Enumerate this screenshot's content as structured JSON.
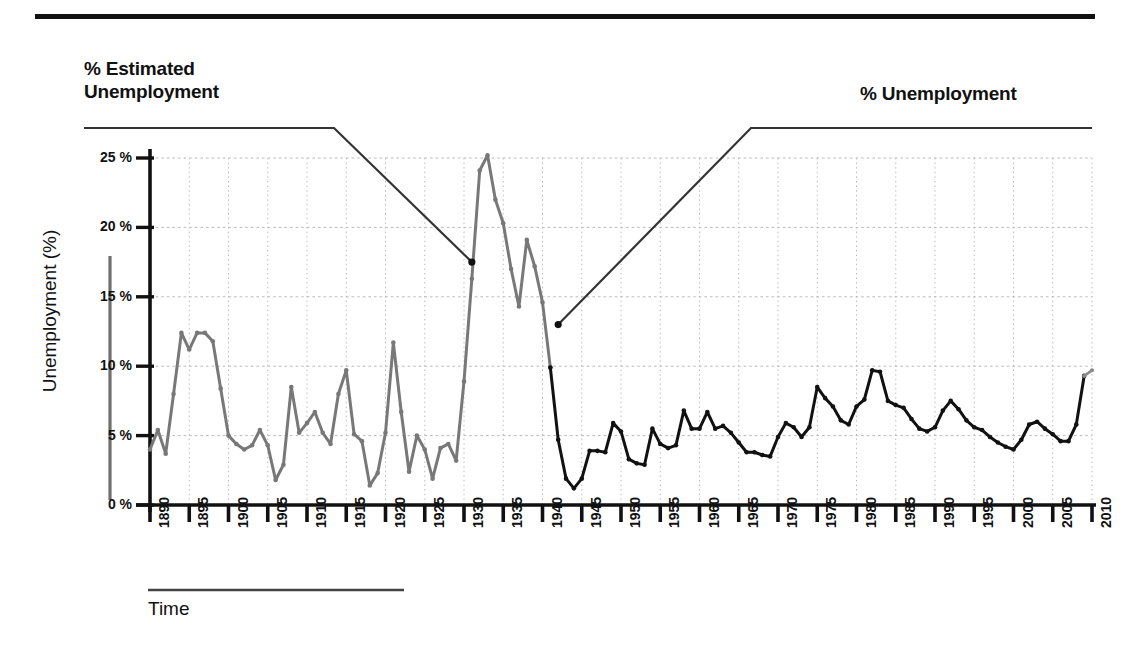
{
  "figure": {
    "top_rule": "horizontal-rule",
    "labels": {
      "left_annotation": "% Estimated\nUnemployment",
      "right_annotation": "% Unemployment"
    }
  },
  "chart_data": {
    "type": "line",
    "title": "",
    "xlabel": "Time",
    "ylabel": "Unemployment (%)",
    "xlim": [
      1890,
      2010
    ],
    "ylim": [
      0,
      25
    ],
    "grid": true,
    "grid_x_step": 5,
    "grid_y_step": 5,
    "legend_position": "annotations-with-leader-lines",
    "ytick_labels": [
      "25 %",
      "20 %",
      "15 %",
      "10 %",
      "5 %",
      "0 %"
    ],
    "ytick_values": [
      25,
      20,
      15,
      10,
      5,
      0
    ],
    "xtick_labels": [
      "1890",
      "1895",
      "1900",
      "1905",
      "1910",
      "1915",
      "1920",
      "1925",
      "1930",
      "1935",
      "1940",
      "1945",
      "1950",
      "1955",
      "1960",
      "1965",
      "1970",
      "1975",
      "1980",
      "1985",
      "1990",
      "1995",
      "2000",
      "2005",
      "2010"
    ],
    "xtick_values": [
      1890,
      1895,
      1900,
      1905,
      1910,
      1915,
      1920,
      1925,
      1930,
      1935,
      1940,
      1945,
      1950,
      1955,
      1960,
      1965,
      1970,
      1975,
      1980,
      1985,
      1990,
      1995,
      2000,
      2005,
      2010
    ],
    "colors": {
      "estimated_series": "#787878",
      "official_series": "#111111",
      "grid": "#b9b9b9",
      "axis": "#111111"
    },
    "series": [
      {
        "name": "% Estimated Unemployment",
        "color": "#787878",
        "x": [
          1890,
          1891,
          1892,
          1893,
          1894,
          1895,
          1896,
          1897,
          1898,
          1899,
          1900,
          1901,
          1902,
          1903,
          1904,
          1905,
          1906,
          1907,
          1908,
          1909,
          1910,
          1911,
          1912,
          1913,
          1914,
          1915,
          1916,
          1917,
          1918,
          1919,
          1920,
          1921,
          1922,
          1923,
          1924,
          1925,
          1926,
          1927,
          1928,
          1929,
          1930,
          1931,
          1932,
          1933,
          1934,
          1935,
          1936,
          1937,
          1938,
          1939,
          1940,
          1941
        ],
        "values": [
          4.0,
          5.4,
          3.7,
          8.0,
          12.4,
          11.2,
          12.4,
          12.4,
          11.8,
          8.4,
          5.0,
          4.4,
          4.0,
          4.3,
          5.4,
          4.3,
          1.8,
          2.9,
          8.5,
          5.2,
          5.9,
          6.7,
          5.2,
          4.4,
          8.0,
          9.7,
          5.1,
          4.6,
          1.4,
          2.3,
          5.2,
          11.7,
          6.7,
          2.4,
          5.0,
          4.0,
          1.9,
          4.1,
          4.4,
          3.2,
          8.9,
          16.3,
          24.1,
          25.2,
          22.0,
          20.3,
          17.0,
          14.3,
          19.1,
          17.2,
          14.6,
          9.9
        ]
      },
      {
        "name": "% Unemployment",
        "color": "#111111",
        "x": [
          1941,
          1942,
          1943,
          1944,
          1945,
          1946,
          1947,
          1948,
          1949,
          1950,
          1951,
          1952,
          1953,
          1954,
          1955,
          1956,
          1957,
          1958,
          1959,
          1960,
          1961,
          1962,
          1963,
          1964,
          1965,
          1966,
          1967,
          1968,
          1969,
          1970,
          1971,
          1972,
          1973,
          1974,
          1975,
          1976,
          1977,
          1978,
          1979,
          1980,
          1981,
          1982,
          1983,
          1984,
          1985,
          1986,
          1987,
          1988,
          1989,
          1990,
          1991,
          1992,
          1993,
          1994,
          1995,
          1996,
          1997,
          1998,
          1999,
          2000,
          2001,
          2002,
          2003,
          2004,
          2005,
          2006,
          2007,
          2008,
          2009
        ],
        "values": [
          9.9,
          4.7,
          1.9,
          1.2,
          1.9,
          3.9,
          3.9,
          3.8,
          5.9,
          5.3,
          3.3,
          3.0,
          2.9,
          5.5,
          4.4,
          4.1,
          4.3,
          6.8,
          5.5,
          5.5,
          6.7,
          5.5,
          5.7,
          5.2,
          4.5,
          3.8,
          3.8,
          3.6,
          3.5,
          4.9,
          5.9,
          5.6,
          4.9,
          5.6,
          8.5,
          7.7,
          7.1,
          6.1,
          5.8,
          7.1,
          7.6,
          9.7,
          9.6,
          7.5,
          7.2,
          7.0,
          6.2,
          5.5,
          5.3,
          5.6,
          6.8,
          7.5,
          6.9,
          6.1,
          5.6,
          5.4,
          4.9,
          4.5,
          4.2,
          4.0,
          4.7,
          5.8,
          6.0,
          5.5,
          5.1,
          4.6,
          4.6,
          5.8,
          9.3
        ]
      },
      {
        "name": "% Unemployment (final year)",
        "color": "#8a8a8a",
        "x": [
          2009,
          2010
        ],
        "values": [
          9.3,
          9.7
        ]
      }
    ],
    "annotations": [
      {
        "label": "% Estimated Unemployment",
        "leader_from_x": 1931,
        "leader_from_y": 17.5
      },
      {
        "label": "% Unemployment",
        "leader_from_x": 1942,
        "leader_from_y": 13.0
      }
    ]
  }
}
